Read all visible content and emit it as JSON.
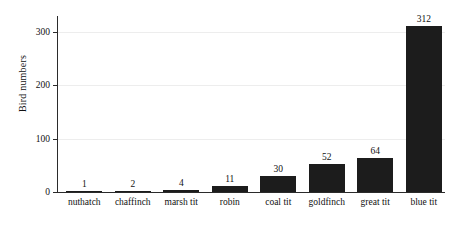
{
  "chart_data": {
    "type": "bar",
    "title": "",
    "subtitle": "",
    "xlabel": "",
    "ylabel": "Bird numbers",
    "categories": [
      "nuthatch",
      "chaffinch",
      "marsh tit",
      "robin",
      "coal tit",
      "goldfinch",
      "great tit",
      "blue tit"
    ],
    "values": [
      1,
      2,
      4,
      11,
      30,
      52,
      64,
      312
    ],
    "value_labels": [
      "1",
      "2",
      "4",
      "11",
      "30",
      "52",
      "64",
      "312"
    ],
    "ylim": [
      0,
      330
    ],
    "yticks": [
      0,
      100,
      200,
      300
    ],
    "ytick_labels": [
      "0",
      "100",
      "200",
      "300"
    ],
    "grid": true,
    "grid_axis": "y",
    "legend": false,
    "legend_position": "none",
    "bar_color": "#1c1c1c",
    "background_color": "#ffffff",
    "axis_color": "#2b2b2b",
    "gridline_color": "#ededed"
  }
}
